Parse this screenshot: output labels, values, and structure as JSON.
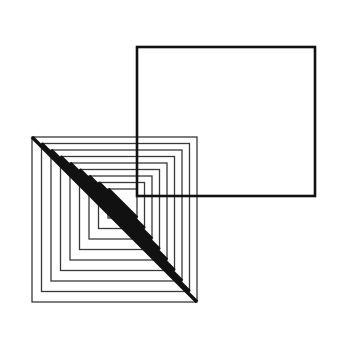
{
  "figure": {
    "canvas": {
      "width": 342,
      "height": 337,
      "background": "#ffffff"
    },
    "colors": {
      "square_stroke": "#3a3a3a",
      "diagonal_stroke": "#111111",
      "rectangle_stroke": "#111111",
      "background": "#ffffff"
    },
    "nested_squares": {
      "name": "nested-squares-group",
      "count": 9,
      "stroke_width": 1.3,
      "diagonal_stroke_width": 3.6,
      "step": 9.5,
      "outer": {
        "x": 32,
        "y": 137,
        "size": 165
      },
      "squares": [
        {
          "x": 32.0,
          "y": 137.0,
          "size": 165.0
        },
        {
          "x": 41.5,
          "y": 143.5,
          "size": 148.0
        },
        {
          "x": 51.0,
          "y": 150.0,
          "size": 131.0
        },
        {
          "x": 60.5,
          "y": 156.5,
          "size": 114.0
        },
        {
          "x": 70.0,
          "y": 163.0,
          "size": 97.0
        },
        {
          "x": 79.5,
          "y": 169.5,
          "size": 80.0
        },
        {
          "x": 89.0,
          "y": 176.0,
          "size": 63.0
        },
        {
          "x": 98.5,
          "y": 182.5,
          "size": 46.0
        },
        {
          "x": 108.0,
          "y": 189.0,
          "size": 29.0
        }
      ]
    },
    "overlay_rectangle": {
      "name": "overlay-rectangle",
      "x": 137,
      "y": 47,
      "width": 178,
      "height": 149,
      "stroke_width": 2.6
    }
  },
  "chart_data": {
    "type": "scatter",
    "xlabel": "",
    "ylabel": "",
    "xlim": [
      0,
      342
    ],
    "ylim": [
      0,
      337
    ],
    "grid": false,
    "legend": "none",
    "annotations": [
      "9 concentric squares drawn as thin outlines",
      "Each nested square carries a thick black diagonal from its top-left corner to its bottom-right corner",
      "A single large rectangle with a thick black outline sits in the upper right and overlaps the upper-right portion of the nested squares"
    ],
    "series": [
      {
        "name": "nested-squares",
        "shape": "square-outline",
        "count": 9,
        "values": [
          165,
          148,
          131,
          114,
          97,
          80,
          63,
          46,
          29
        ]
      },
      {
        "name": "square-diagonals",
        "shape": "line",
        "count": 9,
        "values": [
          165,
          148,
          131,
          114,
          97,
          80,
          63,
          46,
          29
        ]
      },
      {
        "name": "overlay-rectangle",
        "shape": "rectangle-outline",
        "count": 1,
        "values": [
          178,
          149
        ]
      }
    ]
  }
}
